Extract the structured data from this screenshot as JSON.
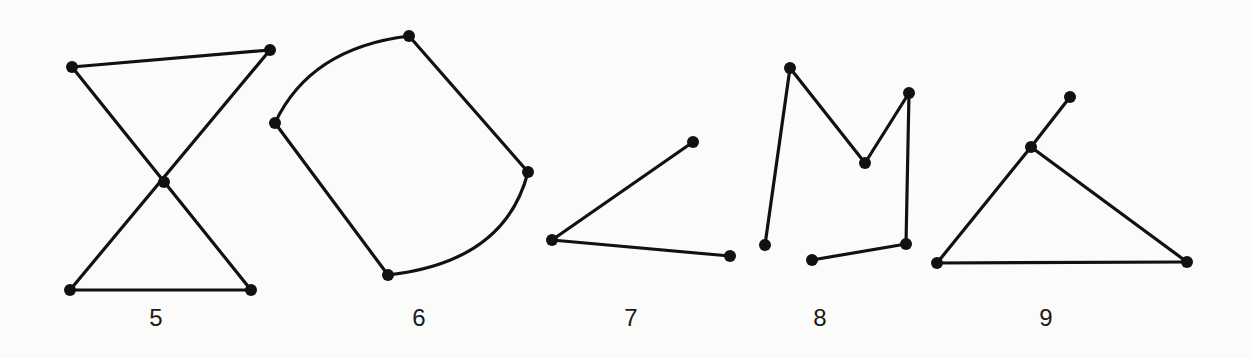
{
  "figures": [
    {
      "label": "5",
      "label_x": 156,
      "shape": "bowtie (self-intersecting)",
      "vertices": [
        [
          72,
          67
        ],
        [
          270,
          50
        ],
        [
          164,
          182
        ],
        [
          70,
          290
        ],
        [
          251,
          290
        ]
      ],
      "segments": [
        [
          [
            72,
            67
          ],
          [
            270,
            50
          ]
        ],
        [
          [
            72,
            67
          ],
          [
            251,
            290
          ]
        ],
        [
          [
            270,
            50
          ],
          [
            70,
            290
          ]
        ],
        [
          [
            70,
            290
          ],
          [
            251,
            290
          ]
        ]
      ]
    },
    {
      "label": "6",
      "label_x": 419,
      "shape": "two straight sides, two curved sides",
      "vertices": [
        [
          409,
          36
        ],
        [
          275,
          123
        ],
        [
          528,
          172
        ],
        [
          388,
          275
        ]
      ],
      "segments": [
        [
          [
            275,
            123
          ],
          [
            388,
            275
          ]
        ],
        [
          [
            409,
            36
          ],
          [
            528,
            172
          ]
        ]
      ],
      "arcs": [
        {
          "from": [
            275,
            123
          ],
          "to": [
            409,
            36
          ],
          "ctrl": [
            310,
            48
          ]
        },
        {
          "from": [
            528,
            172
          ],
          "to": [
            388,
            275
          ],
          "ctrl": [
            505,
            262
          ]
        }
      ]
    },
    {
      "label": "7",
      "label_x": 631,
      "shape": "open angle",
      "vertices": [
        [
          693,
          142
        ],
        [
          552,
          240
        ],
        [
          730,
          256
        ]
      ],
      "segments": [
        [
          [
            693,
            142
          ],
          [
            552,
            240
          ]
        ],
        [
          [
            552,
            240
          ],
          [
            730,
            256
          ]
        ]
      ]
    },
    {
      "label": "8",
      "label_x": 820,
      "shape": "open polyline (M-shape)",
      "vertices": [
        [
          765,
          245
        ],
        [
          790,
          68
        ],
        [
          865,
          163
        ],
        [
          909,
          93
        ],
        [
          906,
          244
        ],
        [
          812,
          260
        ]
      ],
      "segments": [
        [
          [
            765,
            245
          ],
          [
            790,
            68
          ]
        ],
        [
          [
            790,
            68
          ],
          [
            865,
            163
          ]
        ],
        [
          [
            865,
            163
          ],
          [
            909,
            93
          ]
        ],
        [
          [
            909,
            93
          ],
          [
            906,
            244
          ]
        ],
        [
          [
            906,
            244
          ],
          [
            812,
            260
          ]
        ]
      ]
    },
    {
      "label": "9",
      "label_x": 1046,
      "shape": "triangle with tail",
      "vertices": [
        [
          1070,
          97
        ],
        [
          1031,
          147
        ],
        [
          937,
          263
        ],
        [
          1187,
          262
        ]
      ],
      "segments": [
        [
          [
            1070,
            97
          ],
          [
            1031,
            147
          ]
        ],
        [
          [
            1031,
            147
          ],
          [
            937,
            263
          ]
        ],
        [
          [
            1031,
            147
          ],
          [
            1187,
            262
          ]
        ],
        [
          [
            937,
            263
          ],
          [
            1187,
            262
          ]
        ]
      ]
    }
  ],
  "style": {
    "stroke": "#111111",
    "background": "#fbfbfa",
    "vertex_radius": 6
  }
}
